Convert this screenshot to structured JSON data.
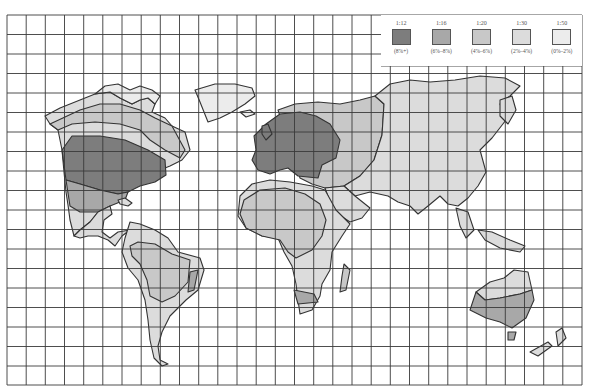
{
  "map": {
    "title": "Global map with shaded regions by ratio",
    "grid": {
      "left": 7,
      "top": 15,
      "right": 582,
      "bottom": 385,
      "columns": 30,
      "rows": 19
    },
    "colors": {
      "outline": "#333333",
      "grid": "#3a3a3a",
      "level1": "#7d7d7d",
      "level2": "#a8a8a8",
      "level3": "#c8c8c8",
      "level4": "#dcdcdc",
      "level5": "#ececec"
    }
  },
  "legend": {
    "items": [
      {
        "ratio": "1:12",
        "range": "(8%+)",
        "color": "#7d7d7d"
      },
      {
        "ratio": "1:16",
        "range": "(6%–8%)",
        "color": "#a8a8a8"
      },
      {
        "ratio": "1:20",
        "range": "(4%–6%)",
        "color": "#c8c8c8"
      },
      {
        "ratio": "1:30",
        "range": "(2%–4%)",
        "color": "#dcdcdc"
      },
      {
        "ratio": "1:50",
        "range": "(0%–2%)",
        "color": "#ececec"
      }
    ]
  }
}
